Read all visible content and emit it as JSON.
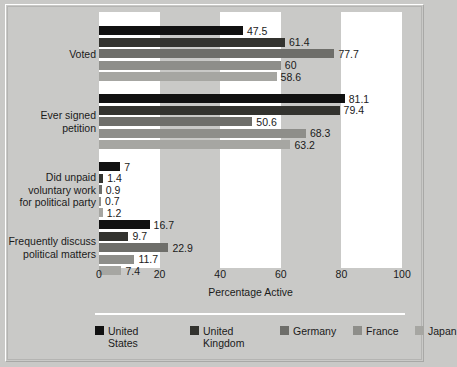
{
  "chart_data": {
    "type": "bar",
    "orientation": "horizontal",
    "title": "",
    "xlabel": "Percentage Active",
    "ylabel": "",
    "xlim": [
      0,
      100
    ],
    "xticks": [
      0,
      20,
      40,
      60,
      80,
      100
    ],
    "grid": false,
    "legend_position": "bottom",
    "categories": [
      "Voted",
      "Ever signed petition",
      "Did unpaid voluntary work for political party",
      "Frequently discuss political matters"
    ],
    "category_label_lines": [
      [
        "Voted"
      ],
      [
        "Ever signed",
        "petition"
      ],
      [
        "Did unpaid",
        "voluntary work",
        "for political party"
      ],
      [
        "Frequently discuss",
        "political matters"
      ]
    ],
    "series": [
      {
        "name": "United States",
        "legend_lines": [
          "United",
          "States"
        ],
        "color": "#111111",
        "values": [
          47.5,
          81.1,
          7,
          16.7
        ],
        "labels": [
          "47.5",
          "81.1",
          "7",
          "16.7"
        ]
      },
      {
        "name": "United Kingdom",
        "legend_lines": [
          "United",
          "Kingdom"
        ],
        "color": "#33332f",
        "values": [
          61.4,
          79.4,
          1.4,
          9.7
        ],
        "labels": [
          "61.4",
          "79.4",
          "1.4",
          "9.7"
        ]
      },
      {
        "name": "Germany",
        "legend_lines": [
          "Germany"
        ],
        "color": "#6e6e6a",
        "values": [
          77.7,
          50.6,
          0.9,
          22.9
        ],
        "labels": [
          "77.7",
          "50.6",
          "0.9",
          "22.9"
        ]
      },
      {
        "name": "France",
        "legend_lines": [
          "France"
        ],
        "color": "#8e8e8a",
        "values": [
          60,
          68.3,
          0.7,
          11.7
        ],
        "labels": [
          "60",
          "68.3",
          "0.7",
          "11.7"
        ]
      },
      {
        "name": "Japan",
        "legend_lines": [
          "Japan"
        ],
        "color": "#a6a6a2",
        "values": [
          58.6,
          63.2,
          1.2,
          7.4
        ],
        "labels": [
          "58.6",
          "63.2",
          "1.2",
          "7.4"
        ]
      }
    ],
    "background_bands": [
      {
        "from": 0,
        "to": 20,
        "shade": "white"
      },
      {
        "from": 20,
        "to": 40,
        "shade": "gray"
      },
      {
        "from": 40,
        "to": 60,
        "shade": "white"
      },
      {
        "from": 60,
        "to": 80,
        "shade": "gray"
      },
      {
        "from": 80,
        "to": 100,
        "shade": "white"
      }
    ]
  },
  "colors": {
    "page_background": "#c9c9c7",
    "plot_band_light": "#ffffff",
    "plot_band_dark": "#c9c9c7",
    "text": "#1a1a1a",
    "frame": "#b4b4b2",
    "legend_separator": "#ffffff"
  }
}
